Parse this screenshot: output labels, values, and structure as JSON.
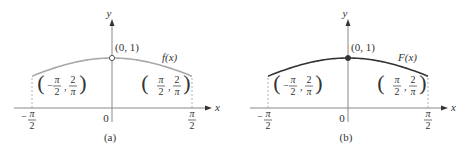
{
  "chart_data": [
    {
      "type": "line",
      "panel_label": "(a)",
      "function_label": "f(x)",
      "function": "sin(x)/x",
      "xlim": [
        -1.5708,
        1.5708
      ],
      "ylim": [
        0,
        1
      ],
      "x_axis_label": "x",
      "y_axis_label": "y",
      "x_tick_labels": [
        "-π/2",
        "0",
        "π/2"
      ],
      "points": [
        {
          "label": "(0, 1)",
          "x": 0,
          "y": 1,
          "marker": "open-circle"
        },
        {
          "label": "(-π/2, 2/π)",
          "x": -1.5708,
          "y": 0.6366
        },
        {
          "label": "(π/2, 2/π)",
          "x": 1.5708,
          "y": 0.6366
        }
      ],
      "curve_color": "#a8a8a8",
      "marker_fill": "#ffffff"
    },
    {
      "type": "line",
      "panel_label": "(b)",
      "function_label": "F(x)",
      "function": "sin(x)/x, F(0)=1",
      "xlim": [
        -1.5708,
        1.5708
      ],
      "ylim": [
        0,
        1
      ],
      "x_axis_label": "x",
      "y_axis_label": "y",
      "x_tick_labels": [
        "-π/2",
        "0",
        "π/2"
      ],
      "points": [
        {
          "label": "(0, 1)",
          "x": 0,
          "y": 1,
          "marker": "filled-circle"
        },
        {
          "label": "(-π/2, 2/π)",
          "x": -1.5708,
          "y": 0.6366
        },
        {
          "label": "(π/2, 2/π)",
          "x": 1.5708,
          "y": 0.6366
        }
      ],
      "curve_color": "#333333",
      "marker_fill": "#333333"
    }
  ],
  "text": {
    "pi": "π",
    "two": "2",
    "minus": "−",
    "comma": ","
  }
}
